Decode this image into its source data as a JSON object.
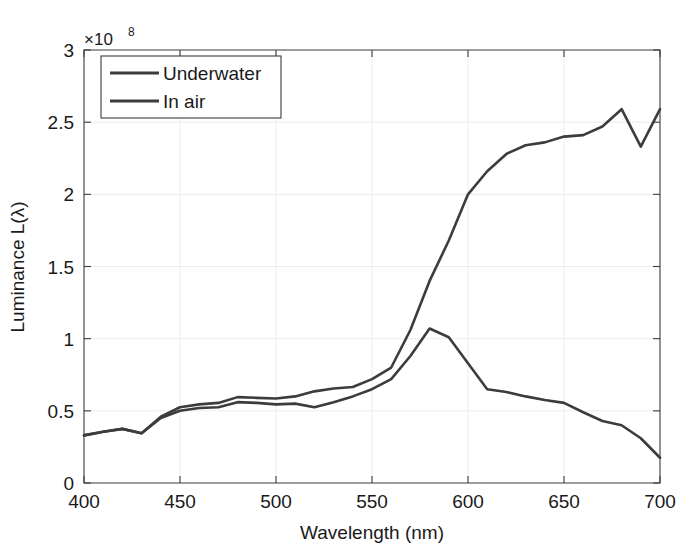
{
  "chart_data": {
    "type": "line",
    "title": "",
    "xlabel": "Wavelength (nm)",
    "ylabel": "Luminance L(λ)",
    "y_exponent_label": "×10",
    "y_exponent_power": "8",
    "y_multiplier": 100000000,
    "xlim": [
      400,
      700
    ],
    "ylim": [
      0,
      3
    ],
    "xticks": [
      400,
      450,
      500,
      550,
      600,
      650,
      700
    ],
    "xticklabels": [
      "400",
      "450",
      "500",
      "550",
      "600",
      "650",
      "700"
    ],
    "yticks": [
      0,
      0.5,
      1,
      1.5,
      2,
      2.5,
      3
    ],
    "yticklabels": [
      "0",
      "0.5",
      "1",
      "1.5",
      "2",
      "2.5",
      "3"
    ],
    "grid": true,
    "legend_position": "upper left",
    "x": [
      400,
      410,
      420,
      430,
      440,
      450,
      460,
      470,
      480,
      490,
      500,
      510,
      520,
      530,
      540,
      550,
      560,
      570,
      580,
      590,
      600,
      610,
      620,
      630,
      640,
      650,
      660,
      670,
      680,
      690,
      700
    ],
    "series": [
      {
        "name": "Underwater",
        "color": "#3c3c3c",
        "values": [
          0.33,
          0.355,
          0.375,
          0.345,
          0.45,
          0.5,
          0.52,
          0.525,
          0.56,
          0.555,
          0.545,
          0.55,
          0.525,
          0.56,
          0.6,
          0.65,
          0.72,
          0.88,
          1.07,
          1.01,
          0.83,
          0.65,
          0.63,
          0.6,
          0.575,
          0.555,
          0.49,
          0.43,
          0.4,
          0.31,
          0.175
        ]
      },
      {
        "name": "In air",
        "color": "#3c3c3c",
        "values": [
          0.33,
          0.355,
          0.375,
          0.345,
          0.46,
          0.525,
          0.545,
          0.555,
          0.595,
          0.59,
          0.585,
          0.6,
          0.635,
          0.655,
          0.665,
          0.72,
          0.8,
          1.06,
          1.4,
          1.68,
          2.0,
          2.16,
          2.28,
          2.34,
          2.36,
          2.4,
          2.41,
          2.47,
          2.59,
          2.33,
          2.59
        ]
      }
    ],
    "legend": [
      {
        "label": "Underwater",
        "color": "#3c3c3c"
      },
      {
        "label": "In air",
        "color": "#3c3c3c"
      }
    ]
  }
}
